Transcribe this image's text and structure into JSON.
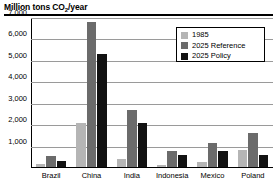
{
  "title": {
    "prefix": "Million tons CO",
    "sub": "2",
    "suffix": "/year",
    "full": "Million tons CO2/year"
  },
  "legend": {
    "position": "top-right",
    "entries": [
      {
        "label": "1985",
        "color": "#b5b5b5"
      },
      {
        "label": "2025 Reference",
        "color": "#6b6b6b"
      },
      {
        "label": "2025 Policy",
        "color": "#121212"
      }
    ]
  },
  "axis": {
    "y_ticks": [
      "1,000",
      "2,000",
      "3,000",
      "4,000",
      "5,000",
      "6,000",
      "7,000"
    ],
    "y_label": "",
    "x_label": ""
  },
  "chart_data": {
    "type": "bar",
    "title": "Million tons CO2/year",
    "xlabel": "",
    "ylabel": "Million tons CO2/year",
    "ylim": [
      0,
      7000
    ],
    "ytick_values": [
      1000,
      2000,
      3000,
      4000,
      5000,
      6000,
      7000
    ],
    "grid": true,
    "legend_position": "top-right",
    "categories": [
      "Brazil",
      "China",
      "India",
      "Indonesia",
      "Mexico",
      "Poland"
    ],
    "series": [
      {
        "name": "1985",
        "color": "#b5b5b5",
        "values": [
          180,
          2100,
          420,
          140,
          290,
          830
        ]
      },
      {
        "name": "2025 Reference",
        "color": "#6b6b6b",
        "values": [
          560,
          6800,
          2700,
          800,
          1150,
          1620
        ]
      },
      {
        "name": "2025 Policy",
        "color": "#121212",
        "values": [
          330,
          5300,
          2100,
          620,
          790,
          620
        ]
      }
    ]
  }
}
